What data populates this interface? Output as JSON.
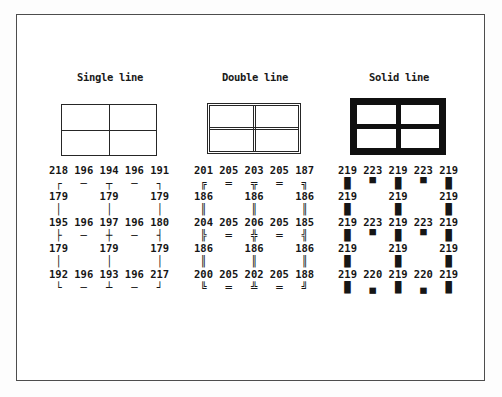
{
  "page": {
    "colors": {
      "ink": "#1a1a1a",
      "frame_border": "#4d4d4d",
      "background": "#ffffff"
    }
  },
  "sections": [
    {
      "title": "Single line",
      "line_style": "single",
      "code_rows": [
        [
          218,
          196,
          194,
          196,
          191
        ],
        [
          179,
          179,
          179
        ],
        [
          195,
          196,
          197,
          196,
          180
        ],
        [
          179,
          179,
          179
        ],
        [
          192,
          196,
          193,
          196,
          217
        ]
      ],
      "glyph_rows": [
        [
          "┌",
          "─",
          "┬",
          "─",
          "┐"
        ],
        [
          "│",
          "│",
          "│"
        ],
        [
          "├",
          "─",
          "┼",
          "─",
          "┤"
        ],
        [
          "│",
          "│",
          "│"
        ],
        [
          "└",
          "─",
          "┴",
          "─",
          "┘"
        ]
      ],
      "grid_lines": [
        "218 196 194 196 191",
        " ┌   ─   ┬   ─   ┐ ",
        "179     179     179",
        " │       │       │ ",
        "195 196 197 196 180",
        " ├   ─   ┼   ─   ┤ ",
        "179     179     179",
        " │       │       │ ",
        "192 196 193 196 217",
        " └   ─   ┴   ─   ┘ "
      ]
    },
    {
      "title": "Double line",
      "line_style": "double",
      "code_rows": [
        [
          201,
          205,
          203,
          205,
          187
        ],
        [
          186,
          186,
          186
        ],
        [
          204,
          205,
          206,
          205,
          185
        ],
        [
          186,
          186,
          186
        ],
        [
          200,
          205,
          202,
          205,
          188
        ]
      ],
      "glyph_rows": [
        [
          "╔",
          "═",
          "╦",
          "═",
          "╗"
        ],
        [
          "║",
          "║",
          "║"
        ],
        [
          "╠",
          "═",
          "╬",
          "═",
          "╣"
        ],
        [
          "║",
          "║",
          "║"
        ],
        [
          "╚",
          "═",
          "╩",
          "═",
          "╝"
        ]
      ],
      "grid_lines": [
        "201 205 203 205 187",
        " ╔   ═   ╦   ═   ╗ ",
        "186     186     186",
        " ║       ║       ║ ",
        "204 205 206 205 185",
        " ╠   ═   ╬   ═   ╣ ",
        "186     186     186",
        " ║       ║       ║ ",
        "200 205 202 205 188",
        " ╚   ═   ╩   ═   ╝ "
      ]
    },
    {
      "title": "Solid line",
      "line_style": "solid",
      "code_rows": [
        [
          219,
          223,
          219,
          223,
          219
        ],
        [
          219,
          219,
          219
        ],
        [
          219,
          223,
          219,
          223,
          219
        ],
        [
          219,
          219,
          219
        ],
        [
          219,
          220,
          219,
          220,
          219
        ]
      ],
      "glyph_rows": [
        [
          "█",
          "▀",
          "█",
          "▀",
          "█"
        ],
        [
          "█",
          "█",
          "█"
        ],
        [
          "█",
          "▀",
          "█",
          "▀",
          "█"
        ],
        [
          "█",
          "█",
          "█"
        ],
        [
          "█",
          "▄",
          "█",
          "▄",
          "█"
        ]
      ],
      "grid_lines": [
        "219 223 219 223 219",
        " █   ▀   █   ▀   █ ",
        "219     219     219",
        " █       █       █ ",
        "219 223 219 223 219",
        " █   ▀   █   ▀   █ ",
        "219     219     219",
        " █       █       █ ",
        "219 220 219 220 219",
        " █   ▄   █   ▄   █ "
      ]
    }
  ]
}
